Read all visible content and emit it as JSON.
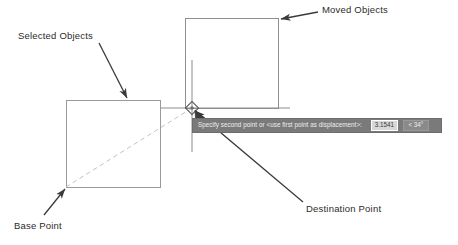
{
  "canvas": {
    "width": 458,
    "height": 245,
    "background": "#ffffff"
  },
  "colors": {
    "object_outline": "#9a9a9a",
    "displacement_line": "#bdbdbd",
    "crosshair": "#8c8c8c",
    "annotation_text": "#2b2b2b",
    "arrow": "#3a3a3a",
    "command_bar_bg": "#7a7a7a",
    "command_bar_text": "#efefef",
    "distance_field_bg": "#d8d8d8",
    "angle_field_bg": "#8a8a8a"
  },
  "annotations": [
    {
      "id": "selected-objects",
      "label": "Selected Objects"
    },
    {
      "id": "moved-objects",
      "label": "Moved Objects"
    },
    {
      "id": "base-point",
      "label": "Base Point"
    },
    {
      "id": "destination-point",
      "label": "Destination Point"
    }
  ],
  "command_bar": {
    "prompt": "Specify second point or <use first point as displacement>:",
    "distance_value": "3.1541",
    "angle_value": "< 34°"
  },
  "shapes": {
    "source_rectangle": {
      "x": 66,
      "y": 100,
      "width": 94,
      "height": 87
    },
    "moved_rectangle": {
      "x": 185,
      "y": 18,
      "width": 93,
      "height": 90
    },
    "base_point": {
      "x": 66,
      "y": 187
    },
    "destination_point": {
      "x": 192,
      "y": 108
    }
  },
  "cursor": {
    "name": "crosshair-with-endpoint-osnap",
    "x": 192,
    "y": 108
  }
}
